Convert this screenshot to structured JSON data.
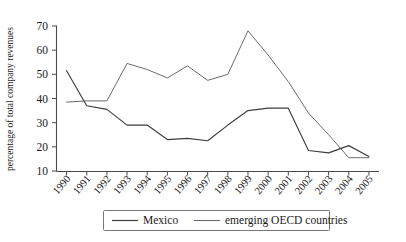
{
  "chart_data": {
    "type": "line",
    "title": "",
    "xlabel": "",
    "ylabel": "percentage of total company revenues",
    "ylim": [
      10,
      70
    ],
    "yticks": [
      10,
      20,
      30,
      40,
      50,
      60,
      70
    ],
    "grid": false,
    "legend_position": "bottom",
    "categories": [
      "1990",
      "1991",
      "1992",
      "1993",
      "1994",
      "1995",
      "1996",
      "1997",
      "1998",
      "1999",
      "2000",
      "2001",
      "2002",
      "2003",
      "2004",
      "2005"
    ],
    "series": [
      {
        "name": "Mexico",
        "color": "#3d3d3d",
        "values": [
          51.5,
          37.0,
          35.5,
          29.0,
          29.0,
          23.0,
          23.5,
          22.5,
          29.0,
          35.0,
          36.0,
          36.0,
          18.5,
          17.5,
          20.5,
          16.0
        ]
      },
      {
        "name": "emerging OECD countries",
        "color": "#6b6b6b",
        "values": [
          38.5,
          39.0,
          39.0,
          54.5,
          52.0,
          48.5,
          53.5,
          47.5,
          50.0,
          68.0,
          58.0,
          47.0,
          34.0,
          25.0,
          15.5,
          15.5
        ]
      }
    ]
  },
  "axes": {
    "y_tick_labels": [
      "70",
      "60",
      "50",
      "40",
      "30",
      "20",
      "10"
    ],
    "y_axis_title": "percentage of total company revenues",
    "x_tick_labels": [
      "1990",
      "1991",
      "1992",
      "1993",
      "1994",
      "1995",
      "1996",
      "1997",
      "1998",
      "1999",
      "2000",
      "2001",
      "2002",
      "2003",
      "2004",
      "2005"
    ]
  },
  "legend": {
    "items": [
      {
        "label": "Mexico"
      },
      {
        "label": "emerging OECD countries"
      }
    ]
  }
}
